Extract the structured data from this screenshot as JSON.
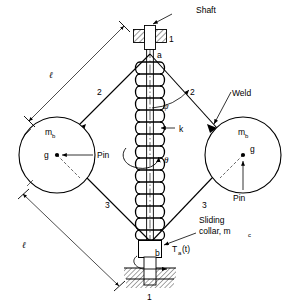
{
  "diagram": {
    "labels": {
      "shaft": "Shaft",
      "weld": "Weld",
      "pin_left": "Pin",
      "pin_right": "Pin",
      "sliding_collar_line1": "Sliding",
      "sliding_collar_line2": "collar, m",
      "sliding_collar_sub": "c",
      "spring_constant": "k",
      "angle_psi": "ψ",
      "angle_theta": "θ",
      "torque": "T",
      "torque_sub": "a",
      "torque_arg": "(t)",
      "point_a": "a",
      "point_b": "b",
      "mass_left": "m",
      "mass_left_sub": "b",
      "mass_right": "m",
      "mass_right_sub": "b",
      "cg_left": "g",
      "cg_right": "g",
      "link_1_top": "1",
      "link_1_bottom": "1",
      "link_2_left": "2",
      "link_2_right": "2",
      "link_3_left": "3",
      "link_3_right": "3",
      "length_upper": "ℓ",
      "length_lower": "ℓ"
    },
    "colors": {
      "stroke": "#000000",
      "background": "#ffffff",
      "fill": "#ffffff"
    },
    "spring": {
      "coil_count": 14,
      "description": "helical compression spring around shaft"
    }
  }
}
